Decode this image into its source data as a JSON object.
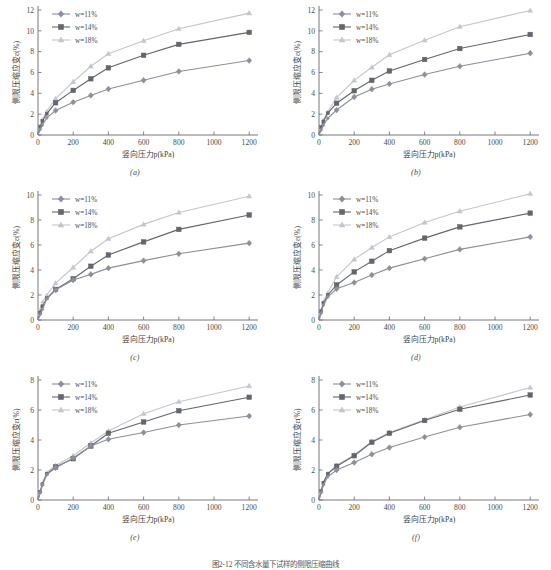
{
  "figure": {
    "caption": "图2-12  不同含水量下试样的侧限压缩曲线",
    "x_axis_title": "竖向压力p(kPa)",
    "y_axis_title": "侧限压缩应变ε(%)",
    "x_ticks": [
      0,
      200,
      400,
      600,
      800,
      1000,
      1200
    ],
    "legend": [
      {
        "key": "w11",
        "label": "w=11%",
        "marker": "diamond",
        "color": "#8d8f9c"
      },
      {
        "key": "w14",
        "label": "w=14%",
        "marker": "square",
        "color": "#63666f"
      },
      {
        "key": "w18",
        "label": "w=18%",
        "marker": "triangle",
        "color": "#c3c6cc"
      }
    ]
  },
  "chart_data": [
    {
      "type": "line",
      "panel": "(a)",
      "title": "",
      "xlabel": "竖向压力p(kPa)",
      "ylabel": "侧限压缩应变ε(%)",
      "xlim": [
        0,
        1250
      ],
      "ylim": [
        0,
        12
      ],
      "yticks": [
        0,
        2,
        4,
        6,
        8,
        10,
        12
      ],
      "xticks": [
        0,
        200,
        400,
        600,
        800,
        1000,
        1200
      ],
      "x": [
        0,
        12.5,
        25,
        50,
        100,
        200,
        300,
        400,
        600,
        800,
        1200
      ],
      "series": [
        {
          "name": "w=11%",
          "values": [
            0,
            0.55,
            0.95,
            1.65,
            2.35,
            3.15,
            3.8,
            4.42,
            5.25,
            6.1,
            7.15
          ]
        },
        {
          "name": "w=14%",
          "values": [
            0,
            0.8,
            1.35,
            2.05,
            3.1,
            4.28,
            5.4,
            6.45,
            7.65,
            8.7,
            9.85
          ]
        },
        {
          "name": "w=18%",
          "values": [
            0,
            0.9,
            1.5,
            2.3,
            3.5,
            5.1,
            6.6,
            7.8,
            9.05,
            10.2,
            11.7
          ]
        }
      ]
    },
    {
      "type": "line",
      "panel": "(b)",
      "title": "",
      "xlabel": "竖向压力p(kPa)",
      "ylabel": "侧限压缩应变ε(%)",
      "xlim": [
        0,
        1250
      ],
      "ylim": [
        0,
        12
      ],
      "yticks": [
        0,
        2,
        4,
        6,
        8,
        10,
        12
      ],
      "xticks": [
        0,
        200,
        400,
        600,
        800,
        1000,
        1200
      ],
      "x": [
        0,
        12.5,
        25,
        50,
        100,
        200,
        300,
        400,
        600,
        800,
        1200
      ],
      "series": [
        {
          "name": "w=11%",
          "values": [
            0,
            0.5,
            0.95,
            1.6,
            2.4,
            3.65,
            4.4,
            4.9,
            5.8,
            6.6,
            7.85
          ]
        },
        {
          "name": "w=14%",
          "values": [
            0,
            0.75,
            1.3,
            2.1,
            3.05,
            4.25,
            5.25,
            6.15,
            7.25,
            8.3,
            9.65
          ]
        },
        {
          "name": "w=18%",
          "values": [
            0,
            0.85,
            1.45,
            2.25,
            3.6,
            5.25,
            6.5,
            7.7,
            9.1,
            10.4,
            11.95
          ]
        }
      ]
    },
    {
      "type": "line",
      "panel": "(c)",
      "title": "",
      "xlabel": "竖向压力p(kPa)",
      "ylabel": "侧限压缩应变ε(%)",
      "xlim": [
        0,
        1250
      ],
      "ylim": [
        0,
        10
      ],
      "yticks": [
        0,
        2,
        4,
        6,
        8,
        10
      ],
      "xticks": [
        0,
        200,
        400,
        600,
        800,
        1000,
        1200
      ],
      "x": [
        0,
        12.5,
        25,
        50,
        100,
        200,
        300,
        400,
        600,
        800,
        1200
      ],
      "series": [
        {
          "name": "w=11%",
          "values": [
            0,
            0.45,
            0.85,
            1.7,
            2.4,
            3.2,
            3.65,
            4.15,
            4.75,
            5.3,
            6.15
          ]
        },
        {
          "name": "w=14%",
          "values": [
            0,
            0.6,
            1.1,
            1.75,
            2.45,
            3.3,
            4.3,
            5.2,
            6.25,
            7.25,
            8.4
          ]
        },
        {
          "name": "w=18%",
          "values": [
            0,
            0.85,
            1.45,
            2.0,
            2.95,
            4.2,
            5.5,
            6.5,
            7.65,
            8.6,
            9.9
          ]
        }
      ]
    },
    {
      "type": "line",
      "panel": "(d)",
      "title": "",
      "xlabel": "竖向压力p(kPa)",
      "ylabel": "侧限压缩应变ε(%)",
      "xlim": [
        0,
        1250
      ],
      "ylim": [
        0,
        10
      ],
      "yticks": [
        0,
        2,
        4,
        6,
        8,
        10
      ],
      "xticks": [
        0,
        200,
        400,
        600,
        800,
        1000,
        1200
      ],
      "x": [
        0,
        12.5,
        25,
        50,
        100,
        200,
        300,
        400,
        600,
        800,
        1200
      ],
      "series": [
        {
          "name": "w=11%",
          "values": [
            0,
            0.55,
            1.2,
            1.85,
            2.5,
            3.0,
            3.6,
            4.15,
            4.9,
            5.65,
            6.65
          ]
        },
        {
          "name": "w=14%",
          "values": [
            0,
            0.7,
            1.35,
            2.0,
            2.8,
            3.85,
            4.7,
            5.55,
            6.55,
            7.45,
            8.55
          ]
        },
        {
          "name": "w=18%",
          "values": [
            0,
            0.8,
            1.5,
            2.2,
            3.45,
            4.85,
            5.8,
            6.65,
            7.8,
            8.7,
            10.1
          ]
        }
      ]
    },
    {
      "type": "line",
      "panel": "(e)",
      "title": "",
      "xlabel": "竖向压力p(kPa)",
      "ylabel": "侧限压缩应变ε(%)",
      "xlim": [
        0,
        1250
      ],
      "ylim": [
        0,
        8
      ],
      "yticks": [
        0,
        2,
        4,
        6,
        8
      ],
      "xticks": [
        0,
        200,
        400,
        600,
        800,
        1000,
        1200
      ],
      "x": [
        0,
        12.5,
        25,
        50,
        100,
        200,
        300,
        400,
        600,
        800,
        1200
      ],
      "series": [
        {
          "name": "w=11%",
          "values": [
            0,
            0.5,
            1.0,
            1.7,
            2.15,
            2.8,
            3.6,
            4.05,
            4.5,
            5.0,
            5.6
          ]
        },
        {
          "name": "w=14%",
          "values": [
            0,
            0.55,
            1.05,
            1.75,
            2.2,
            2.75,
            3.6,
            4.45,
            5.2,
            5.95,
            6.85
          ]
        },
        {
          "name": "w=18%",
          "values": [
            0,
            0.6,
            1.15,
            1.85,
            2.3,
            2.95,
            3.8,
            4.6,
            5.75,
            6.55,
            7.6
          ]
        }
      ]
    },
    {
      "type": "line",
      "panel": "(f)",
      "title": "",
      "xlabel": "竖向压力p(kPa)",
      "ylabel": "侧限压缩应变ε(%)",
      "xlim": [
        0,
        1250
      ],
      "ylim": [
        0,
        8
      ],
      "yticks": [
        0,
        2,
        4,
        6,
        8
      ],
      "xticks": [
        0,
        200,
        400,
        600,
        800,
        1000,
        1200
      ],
      "x": [
        0,
        12.5,
        25,
        50,
        100,
        200,
        300,
        400,
        600,
        800,
        1200
      ],
      "series": [
        {
          "name": "w=11%",
          "values": [
            0,
            0.5,
            1.0,
            1.55,
            2.0,
            2.5,
            3.05,
            3.5,
            4.2,
            4.85,
            5.7
          ]
        },
        {
          "name": "w=14%",
          "values": [
            0,
            0.6,
            1.15,
            1.75,
            2.25,
            2.95,
            3.85,
            4.45,
            5.3,
            6.05,
            7.0
          ]
        },
        {
          "name": "w=18%",
          "values": [
            0,
            0.65,
            1.2,
            1.8,
            2.3,
            3.0,
            3.9,
            4.5,
            5.35,
            6.2,
            7.5
          ]
        }
      ]
    }
  ]
}
